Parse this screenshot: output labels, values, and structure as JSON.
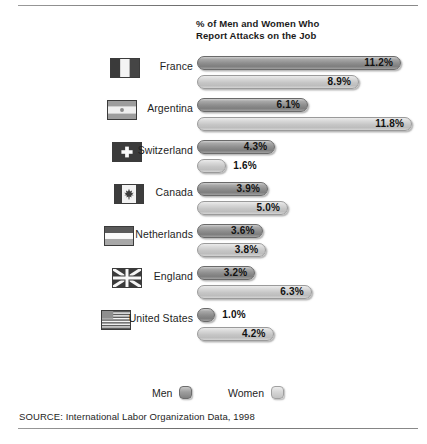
{
  "title": "% of Men and Women Who\nReport Attacks on the Job",
  "title_line1": "% of Men and Women Who",
  "title_line2": "Report Attacks on the Job",
  "legend": {
    "men_label": "Men",
    "women_label": "Women"
  },
  "source": "SOURCE: International Labor Organization Data, 1998",
  "colors": {
    "men_bar": "#8f8f8f",
    "women_bar": "#c6c6c6",
    "text": "#1e1e1e",
    "rule": "#6f6f6f",
    "background": "#ffffff"
  },
  "chart_data": {
    "type": "bar",
    "title": "% of Men and Women Who Report Attacks on the Job",
    "xlabel": "",
    "ylabel": "",
    "orientation": "horizontal",
    "grouped": true,
    "grid": false,
    "legend_position": "bottom",
    "unit": "percent",
    "xlim": [
      0,
      11.8
    ],
    "categories": [
      "France",
      "Argentina",
      "Switzerland",
      "Canada",
      "Netherlands",
      "England",
      "United States"
    ],
    "series": [
      {
        "name": "Men",
        "values": [
          11.2,
          6.1,
          4.3,
          3.9,
          3.6,
          3.2,
          1.0
        ]
      },
      {
        "name": "Women",
        "values": [
          8.9,
          11.8,
          1.6,
          5.0,
          3.8,
          6.3,
          4.2
        ]
      }
    ],
    "rows": [
      {
        "country": "France",
        "flag": "flag-france",
        "men": "11.2%",
        "men_value": 11.2,
        "women": "8.9%",
        "women_value": 8.9
      },
      {
        "country": "Argentina",
        "flag": "flag-argentina",
        "men": "6.1%",
        "men_value": 6.1,
        "women": "11.8%",
        "women_value": 11.8
      },
      {
        "country": "Switzerland",
        "flag": "flag-switzerland",
        "men": "4.3%",
        "men_value": 4.3,
        "women": "1.6%",
        "women_value": 1.6
      },
      {
        "country": "Canada",
        "flag": "flag-canada",
        "men": "3.9%",
        "men_value": 3.9,
        "women": "5.0%",
        "women_value": 5.0
      },
      {
        "country": "Netherlands",
        "flag": "flag-netherlands",
        "men": "3.6%",
        "men_value": 3.6,
        "women": "3.8%",
        "women_value": 3.8
      },
      {
        "country": "England",
        "flag": "flag-england",
        "men": "3.2%",
        "men_value": 3.2,
        "women": "6.3%",
        "women_value": 6.3
      },
      {
        "country": "United States",
        "flag": "flag-united-states",
        "men": "1.0%",
        "men_value": 1.0,
        "women": "4.2%",
        "women_value": 4.2
      }
    ]
  }
}
